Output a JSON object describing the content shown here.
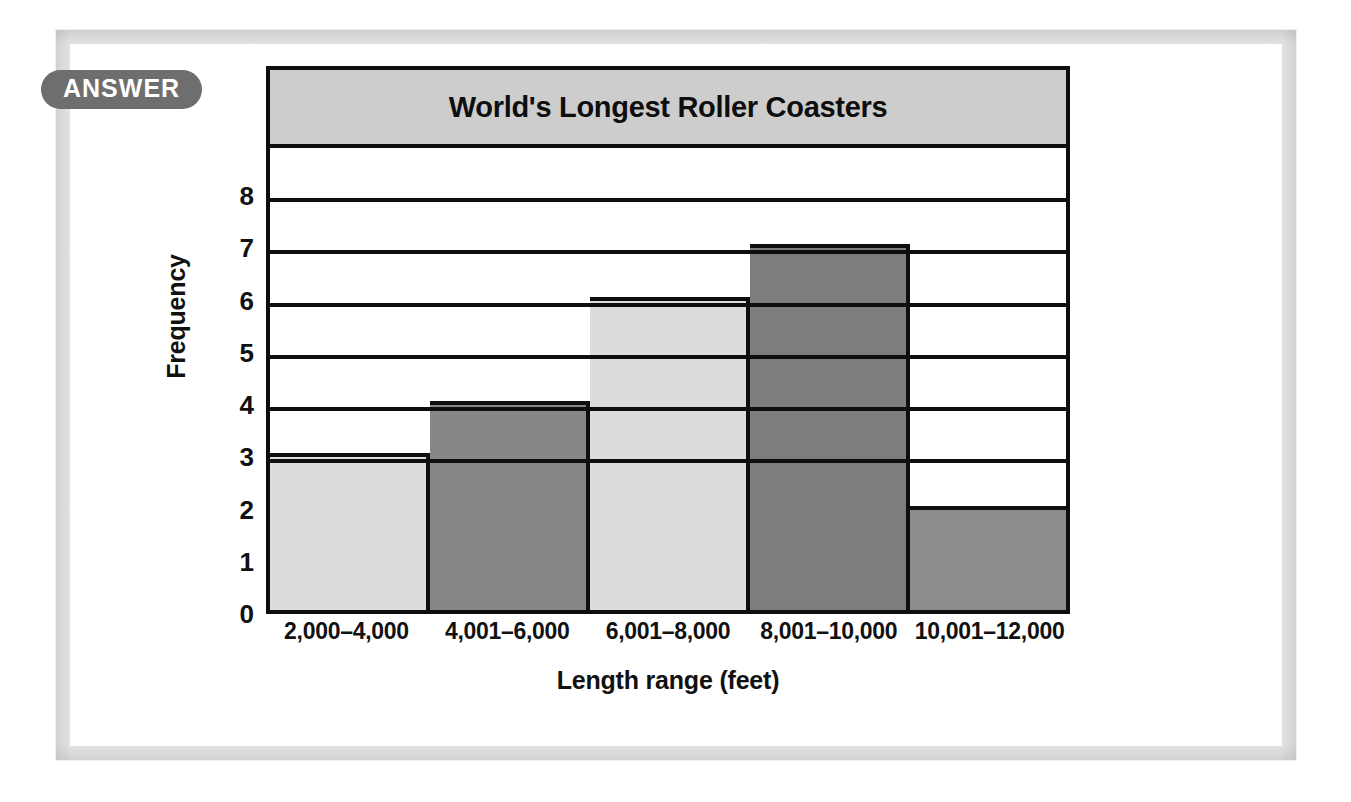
{
  "badge": {
    "label": "ANSWER"
  },
  "chart_data": {
    "type": "bar",
    "title": "World's Longest Roller Coasters",
    "xlabel": "Length range (feet)",
    "ylabel": "Frequency",
    "categories": [
      "2,000–4,000",
      "4,001–6,000",
      "6,001–8,000",
      "8,001–10,000",
      "10,001–12,000"
    ],
    "values": [
      3,
      4,
      6,
      7,
      2
    ],
    "ylim": [
      0,
      9
    ],
    "y_ticks": [
      0,
      1,
      2,
      3,
      4,
      5,
      6,
      7,
      8
    ],
    "gridlines": [
      3,
      4,
      5,
      6,
      7,
      8
    ],
    "grid": true,
    "legend": "none",
    "bar_colors": [
      "#dcdcdc",
      "#878787",
      "#dcdcdc",
      "#7d7d7d",
      "#8c8c8c"
    ],
    "axis_color": "#0e0e0e",
    "title_band_color": "#cdcdcd"
  },
  "colors": {
    "badge_background": "#6e6e6e",
    "badge_text": "#ffffff",
    "frame_border": "#e3e3e3",
    "page_background": "#ffffff"
  }
}
